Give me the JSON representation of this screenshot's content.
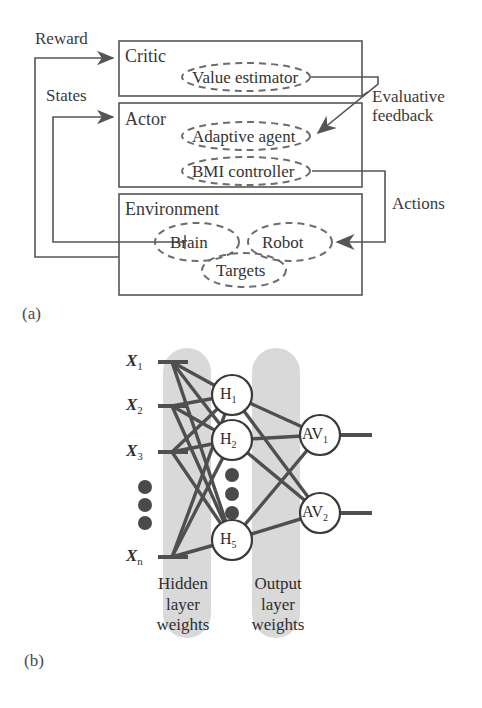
{
  "figure": {
    "panel_a_letter": "(a)",
    "panel_b_letter": "(b)"
  },
  "panel_a": {
    "blocks": [
      {
        "id": "critic",
        "title": "Critic"
      },
      {
        "id": "actor",
        "title": "Actor"
      },
      {
        "id": "environment",
        "title": "Environment"
      }
    ],
    "modules": [
      {
        "id": "value-estimator",
        "label": "Value estimator",
        "parent": "critic"
      },
      {
        "id": "adaptive-agent",
        "label": "Adaptive agent",
        "parent": "actor"
      },
      {
        "id": "bmi-controller",
        "label": "BMI controller",
        "parent": "actor"
      },
      {
        "id": "brain",
        "label": "Brain",
        "parent": "environment"
      },
      {
        "id": "robot",
        "label": "Robot",
        "parent": "environment"
      },
      {
        "id": "targets",
        "label": "Targets",
        "parent": "environment"
      }
    ],
    "signals": [
      {
        "id": "reward",
        "label": "Reward"
      },
      {
        "id": "states",
        "label": "States"
      },
      {
        "id": "evaluative-feedback",
        "label": "Evaluative\nfeedback",
        "line1": "Evaluative",
        "line2": "feedback"
      },
      {
        "id": "actions",
        "label": "Actions"
      }
    ]
  },
  "panel_b": {
    "inputs": [
      {
        "id": "x1",
        "name": "X",
        "sub": "1"
      },
      {
        "id": "x2",
        "name": "X",
        "sub": "2"
      },
      {
        "id": "x3",
        "name": "X",
        "sub": "3"
      },
      {
        "id": "xn",
        "name": "X",
        "sub": "n"
      }
    ],
    "input_ellipsis": "●●●",
    "hidden_nodes": [
      {
        "id": "h1",
        "name": "H",
        "sub": "1"
      },
      {
        "id": "h2",
        "name": "H",
        "sub": "2"
      },
      {
        "id": "h5",
        "name": "H",
        "sub": "5"
      }
    ],
    "hidden_ellipsis": "●●●",
    "output_nodes": [
      {
        "id": "av1",
        "name": "AV",
        "sub": "1"
      },
      {
        "id": "av2",
        "name": "AV",
        "sub": "2"
      }
    ],
    "bands": [
      {
        "id": "hidden-layer-weights",
        "line1": "Hidden",
        "line2": "layer",
        "line3": "weights"
      },
      {
        "id": "output-layer-weights",
        "line1": "Output",
        "line2": "layer",
        "line3": "weights"
      }
    ]
  },
  "colors": {
    "line": "#555555",
    "dashed": "#6d6d6d",
    "band_fill": "#d9d9d9",
    "node_stroke": "#3a3a3a",
    "edge": "#4f4f4f",
    "text": "#333333"
  }
}
